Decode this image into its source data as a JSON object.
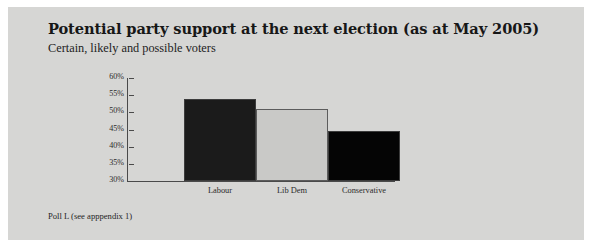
{
  "panel": {
    "background_color": "#d6d6d4"
  },
  "header": {
    "title": "Potential party support at the next election (as at May 2005)",
    "subtitle": "Certain, likely and possible voters"
  },
  "footnote": {
    "text": "Poll L (see apppendix 1)"
  },
  "chart_data": {
    "type": "bar",
    "title": "Potential party support at the next election (as at May 2005)",
    "subtitle": "Certain, likely and possible voters",
    "categories": [
      "Labour",
      "Lib Dem",
      "Conservative"
    ],
    "values": [
      54,
      51,
      44.5
    ],
    "value_labels": [
      "54%",
      "51%",
      "44.5%"
    ],
    "series": [
      {
        "name": "Potential party support",
        "values": [
          54,
          51,
          44.5
        ]
      }
    ],
    "bar_colors": [
      "#1b1b1b",
      "#c9c9c7",
      "#050505"
    ],
    "xlabel": "",
    "ylabel": "",
    "ylim": [
      30,
      60
    ],
    "ytick_values": [
      60,
      55,
      50,
      45,
      40,
      35,
      30
    ],
    "yticks": [
      "60%",
      "55%",
      "50%",
      "45%",
      "40%",
      "35%",
      "30%"
    ],
    "grid": false,
    "legend": false,
    "legend_position": "none",
    "annotations": [
      "Poll L (see apppendix 1)"
    ]
  }
}
